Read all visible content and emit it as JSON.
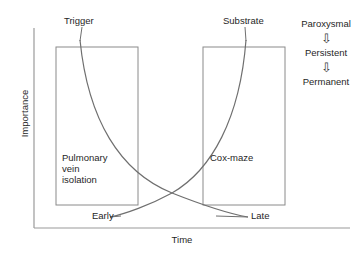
{
  "figure": {
    "axes": {
      "y_label": "Importance",
      "x_label": "Time"
    },
    "boxes": [
      {
        "id": "left-box",
        "label": "Pulmonary\nvein\nisolation"
      },
      {
        "id": "right-box",
        "label": "Cox-maze"
      }
    ],
    "curve_labels": {
      "trigger": "Trigger",
      "substrate": "Substrate",
      "early": "Early",
      "late": "Late"
    },
    "progression": {
      "stages": [
        "Paroxysmal",
        "Persistent",
        "Permanent"
      ],
      "arrow_glyph": "⇩"
    },
    "colors": {
      "line": "#8a8a8a",
      "box_border": "#8a8a8a",
      "text": "#1f1f1f",
      "background": "#ffffff"
    }
  }
}
